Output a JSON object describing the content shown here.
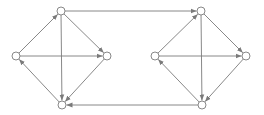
{
  "diagram": {
    "type": "directed-graph",
    "colors": {
      "edge": "#7a7a7a",
      "node_stroke": "#7a7a7a",
      "node_fill": "#ffffff",
      "background": "#ffffff"
    },
    "node_radius": 4,
    "nodes": [
      {
        "id": "L_top",
        "x": 61,
        "y": 11
      },
      {
        "id": "L_left",
        "x": 16,
        "y": 56
      },
      {
        "id": "L_right",
        "x": 107,
        "y": 56
      },
      {
        "id": "L_bottom",
        "x": 62,
        "y": 105
      },
      {
        "id": "R_top",
        "x": 201,
        "y": 11
      },
      {
        "id": "R_left",
        "x": 155,
        "y": 56
      },
      {
        "id": "R_right",
        "x": 246,
        "y": 56
      },
      {
        "id": "R_bottom",
        "x": 202,
        "y": 105
      }
    ],
    "edges": [
      {
        "from": "L_left",
        "to": "L_top"
      },
      {
        "from": "L_top",
        "to": "L_right"
      },
      {
        "from": "L_top",
        "to": "L_bottom"
      },
      {
        "from": "L_left",
        "to": "L_right"
      },
      {
        "from": "L_right",
        "to": "L_bottom"
      },
      {
        "from": "L_bottom",
        "to": "L_left"
      },
      {
        "from": "R_left",
        "to": "R_top"
      },
      {
        "from": "R_top",
        "to": "R_right"
      },
      {
        "from": "R_top",
        "to": "R_bottom"
      },
      {
        "from": "R_left",
        "to": "R_right"
      },
      {
        "from": "R_right",
        "to": "R_bottom"
      },
      {
        "from": "R_bottom",
        "to": "R_left"
      },
      {
        "from": "L_top",
        "to": "R_top"
      },
      {
        "from": "R_bottom",
        "to": "L_bottom"
      }
    ]
  }
}
